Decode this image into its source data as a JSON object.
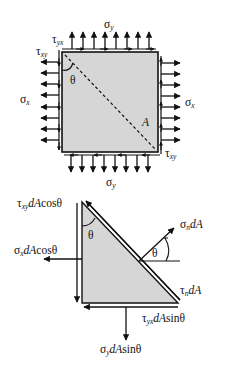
{
  "figure": {
    "top_diagram": {
      "title": "stress element",
      "labels": {
        "sigma_y_top": {
          "base": "σ",
          "sub": "y"
        },
        "sigma_y_bottom": {
          "base": "σ",
          "sub": "y"
        },
        "sigma_x_left": {
          "base": "σ",
          "sub": "x"
        },
        "sigma_x_right": {
          "base": "σ",
          "sub": "x"
        },
        "tau_yx": {
          "base": "τ",
          "sub": "yx"
        },
        "tau_xy_left": {
          "base": "τ",
          "sub": "xy"
        },
        "tau_xy_right": {
          "base": "τ",
          "sub": "xy"
        },
        "theta": "θ",
        "area": "A"
      }
    },
    "bottom_diagram": {
      "title": "free body wedge",
      "labels": {
        "tau_xy_term": {
          "base": "τ",
          "sub": "xy",
          "rest_italic": "dA",
          "rest": "cosθ"
        },
        "sigma_x_term": {
          "base": "σ",
          "sub": "x",
          "rest_italic": "dA",
          "rest": "cosθ"
        },
        "sigma_n_term": {
          "base": "σ",
          "sub": "n",
          "rest_italic": "dA",
          "rest": ""
        },
        "tau_n_term": {
          "base": "τ",
          "sub": "n",
          "rest_italic": "dA",
          "rest": ""
        },
        "tau_yx_term": {
          "base": "τ",
          "sub": "yx",
          "rest_italic": "dA",
          "rest": "sinθ"
        },
        "sigma_y_term": {
          "base": "σ",
          "sub": "y",
          "rest_italic": "dA",
          "rest": "sinθ"
        },
        "theta_wedge": "θ",
        "theta_normal": "θ"
      }
    },
    "colors": {
      "fill": "#d4d4d4",
      "stroke": "#111111"
    }
  }
}
